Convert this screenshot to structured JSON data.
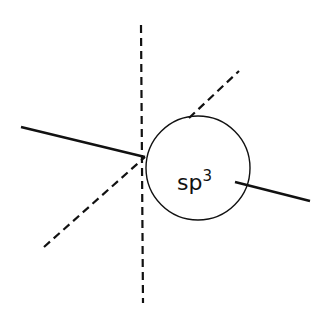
{
  "diagram": {
    "label_main": "sp",
    "label_superscript": "3",
    "colors": {
      "stroke": "#111111",
      "background": "#ffffff"
    },
    "elements": [
      {
        "type": "dashed-line",
        "name": "vertical-axis",
        "from": [
          141,
          25
        ],
        "to": [
          143,
          303
        ]
      },
      {
        "type": "solid-line",
        "name": "left-bond",
        "from": [
          21,
          127
        ],
        "to": [
          145,
          157
        ]
      },
      {
        "type": "dashed-line",
        "name": "diagonal-lower",
        "from": [
          44,
          247
        ],
        "to": [
          145,
          157
        ]
      },
      {
        "type": "dashed-line",
        "name": "diagonal-upper",
        "from": [
          189,
          118
        ],
        "to": [
          239,
          71
        ]
      },
      {
        "type": "circle",
        "name": "sp3-orbital",
        "center": [
          198,
          168
        ],
        "radius": 52
      },
      {
        "type": "solid-line",
        "name": "right-bond",
        "from": [
          235,
          182
        ],
        "to": [
          310,
          201
        ]
      }
    ]
  }
}
